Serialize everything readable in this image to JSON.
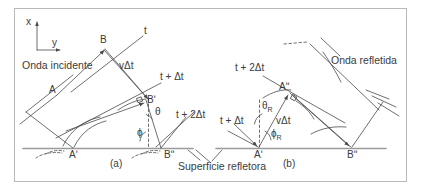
{
  "figure": {
    "caption_a": "(a)",
    "caption_b": "(b)",
    "surface_label": "Superficie refletora",
    "axis": {
      "x": "x",
      "y": "y"
    },
    "colors": {
      "ink": "#4a4a4a",
      "surface": "#9a9a9a",
      "border": "#b9b9b9",
      "background": "#ffffff"
    }
  },
  "panel_a": {
    "title": "Onda incidente",
    "points": {
      "A": "A",
      "B": "B",
      "A_prime": "Aʹ",
      "B_prime": "Bʹ",
      "B_double": "Bʹʹ"
    },
    "wavefronts": {
      "t": "t",
      "t_plus_dt": "t + Δt",
      "t_plus_2dt": "t + 2Δt"
    },
    "distance": "vΔt",
    "angles": {
      "theta": "θ",
      "phi": "ϕ"
    }
  },
  "panel_b": {
    "title": "Onda refletida",
    "points": {
      "A_prime": "Aʹ",
      "A_double": "Aʹʹ",
      "B_double": "Bʹʹ"
    },
    "wavefronts": {
      "t_plus_dt": "t + Δt",
      "t_plus_2dt": "t + 2Δt"
    },
    "distance": "vΔt",
    "angles": {
      "theta_R_base": "θ",
      "theta_R_sub": "R",
      "phi_R_base": "ϕ",
      "phi_R_sub": "R"
    }
  }
}
